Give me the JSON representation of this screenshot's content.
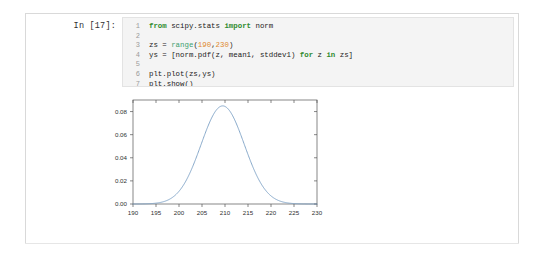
{
  "notebook": {
    "cell": {
      "input_prompt": "In [17]:",
      "code_lines": [
        {
          "n": "1",
          "tokens": [
            {
              "t": "from ",
              "c": "kw"
            },
            {
              "t": "scipy.stats ",
              "c": "plain"
            },
            {
              "t": "import ",
              "c": "kw"
            },
            {
              "t": "norm",
              "c": "plain"
            }
          ]
        },
        {
          "n": "2",
          "tokens": []
        },
        {
          "n": "3",
          "tokens": [
            {
              "t": "zs = ",
              "c": "plain"
            },
            {
              "t": "range",
              "c": "bi"
            },
            {
              "t": "(",
              "c": "plain"
            },
            {
              "t": "190",
              "c": "num"
            },
            {
              "t": ",",
              "c": "plain"
            },
            {
              "t": "230",
              "c": "num"
            },
            {
              "t": ")",
              "c": "plain"
            }
          ]
        },
        {
          "n": "4",
          "tokens": [
            {
              "t": "ys = [norm.pdf(z, mean1, stddev1) ",
              "c": "plain"
            },
            {
              "t": "for ",
              "c": "kw"
            },
            {
              "t": "z ",
              "c": "plain"
            },
            {
              "t": "in ",
              "c": "kw"
            },
            {
              "t": "zs]",
              "c": "plain"
            }
          ]
        },
        {
          "n": "5",
          "tokens": []
        },
        {
          "n": "6",
          "tokens": [
            {
              "t": "plt.plot(zs,ys)",
              "c": "plain"
            }
          ]
        },
        {
          "n": "7",
          "tokens": [
            {
              "t": "plt.show()",
              "c": "plain"
            }
          ]
        }
      ],
      "code_plain": [
        "from scipy.stats import norm",
        "",
        "zs = range(190,230)",
        "ys = [norm.pdf(z, mean1, stddev1) for z in zs]",
        "",
        "plt.plot(zs,ys)",
        "plt.show()"
      ]
    }
  },
  "colors": {
    "line": "#7b9fc4",
    "axis": "#555555",
    "tick_text": "#303030",
    "cell_bg": "#f4f4f4",
    "cell_border": "#e3e3e3",
    "select_bar": "#6aa3e0",
    "keyword": "#2e8b2e",
    "builtin": "#40a070",
    "number": "#e08a2e"
  },
  "chart_data": {
    "type": "line",
    "title": "",
    "xlabel": "",
    "ylabel": "",
    "xlim": [
      190,
      230
    ],
    "ylim": [
      0.0,
      0.09
    ],
    "grid": false,
    "legend": null,
    "xticks": [
      "190",
      "195",
      "200",
      "205",
      "210",
      "215",
      "220",
      "225",
      "230"
    ],
    "xtick_values": [
      190,
      195,
      200,
      205,
      210,
      215,
      220,
      225,
      230
    ],
    "yticks": [
      "0.00",
      "0.02",
      "0.04",
      "0.06",
      "0.08"
    ],
    "ytick_values": [
      0.0,
      0.02,
      0.04,
      0.06,
      0.08
    ],
    "series": [
      {
        "name": "norm.pdf(z, mean1, stddev1)",
        "distribution": "normal",
        "mean": 209.5,
        "stddev": 4.7,
        "peak_value": 0.0849,
        "x": [
          190,
          191,
          192,
          193,
          194,
          195,
          196,
          197,
          198,
          199,
          200,
          201,
          202,
          203,
          204,
          205,
          206,
          207,
          208,
          209,
          210,
          211,
          212,
          213,
          214,
          215,
          216,
          217,
          218,
          219,
          220,
          221,
          222,
          223,
          224,
          225,
          226,
          227,
          228,
          229
        ],
        "y": [
          0.0003,
          0.0005,
          0.0008,
          0.0013,
          0.0021,
          0.0033,
          0.005,
          0.0073,
          0.0103,
          0.0141,
          0.0187,
          0.024,
          0.0299,
          0.0361,
          0.0423,
          0.0481,
          0.0531,
          0.057,
          0.0595,
          0.0604,
          0.0595,
          0.057,
          0.0531,
          0.0481,
          0.0423,
          0.0361,
          0.0299,
          0.024,
          0.0187,
          0.0141,
          0.0103,
          0.0073,
          0.005,
          0.0033,
          0.0021,
          0.0013,
          0.0008,
          0.0005,
          0.0003,
          0.0002
        ]
      }
    ]
  }
}
